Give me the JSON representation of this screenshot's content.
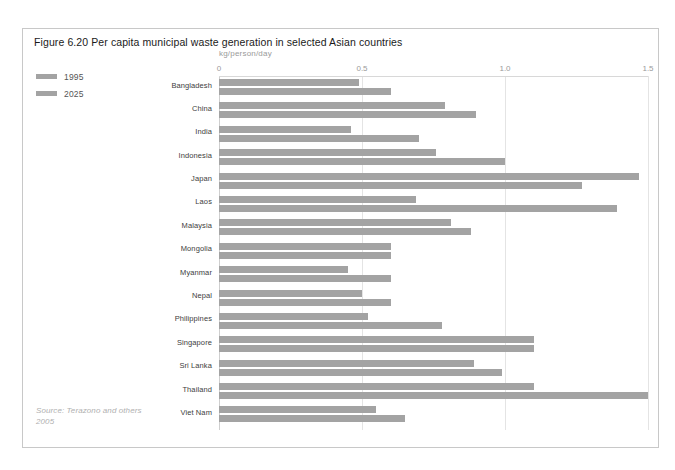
{
  "figure": {
    "title": "Figure 6.20 Per capita municipal waste generation in selected Asian countries",
    "source": "Source: Terazono and others 2005"
  },
  "legend": {
    "items": [
      {
        "label": "1995",
        "color": "#a3a3a3"
      },
      {
        "label": "2025",
        "color": "#a3a3a3"
      }
    ]
  },
  "chart_data": {
    "type": "bar",
    "orientation": "horizontal",
    "title": "Figure 6.20 Per capita municipal waste generation in selected Asian countries",
    "xlabel": "kg/person/day",
    "ylabel": "",
    "xlim": [
      0,
      1.5
    ],
    "xticks": [
      0,
      0.5,
      1.0,
      1.5
    ],
    "xtick_labels": [
      "0",
      "0.5",
      "1.0",
      "1.5"
    ],
    "grid": true,
    "legend_position": "top-left",
    "categories": [
      "Bangladesh",
      "China",
      "India",
      "Indonesia",
      "Japan",
      "Laos",
      "Malaysia",
      "Mongolia",
      "Myanmar",
      "Nepal",
      "Philippines",
      "Singapore",
      "Sri Lanka",
      "Thailand",
      "Viet Nam"
    ],
    "series": [
      {
        "name": "1995",
        "color": "#a3a3a3",
        "values": [
          0.49,
          0.79,
          0.46,
          0.76,
          1.47,
          0.69,
          0.81,
          0.6,
          0.45,
          0.5,
          0.52,
          1.1,
          0.89,
          1.1,
          0.55
        ]
      },
      {
        "name": "2025",
        "color": "#a3a3a3",
        "values": [
          0.6,
          0.9,
          0.7,
          1.0,
          1.27,
          1.39,
          0.88,
          0.6,
          0.6,
          0.6,
          0.78,
          1.1,
          0.99,
          1.5,
          0.65
        ]
      }
    ]
  }
}
